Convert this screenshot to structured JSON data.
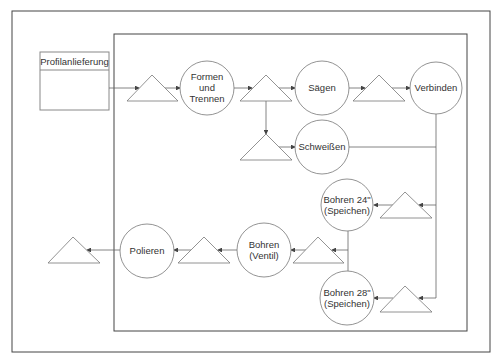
{
  "diagram": {
    "supply_box": {
      "label": "Profilanlieferung"
    },
    "nodes": {
      "formen": [
        "Formen",
        "und",
        "Trennen"
      ],
      "saegen": [
        "Sägen"
      ],
      "verbinden": [
        "Verbinden"
      ],
      "schweissen": [
        "Schweißen"
      ],
      "bohren24": [
        "Bohren 24\"",
        "(Speichen)"
      ],
      "bohren28": [
        "Bohren 28\"",
        "(Speichen)"
      ],
      "bohrenventil": [
        "Bohren",
        "(Ventil)"
      ],
      "polieren": [
        "Polieren"
      ]
    },
    "colors": {
      "line": "#555555",
      "frame": "#444444",
      "text": "#333333"
    }
  }
}
